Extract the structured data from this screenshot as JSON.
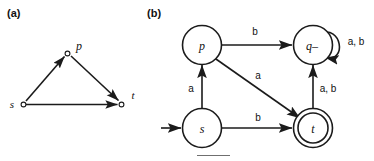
{
  "figure": {
    "panels": [
      {
        "id": "a",
        "label": "(a)",
        "type": "directed-graph",
        "description": "Triangle graph with three vertices and three directed edges",
        "nodes": [
          {
            "id": "s",
            "label": "s",
            "x": 22,
            "y": 104,
            "shape": "small-open-circle"
          },
          {
            "id": "p",
            "label": "p",
            "x": 68,
            "y": 51,
            "shape": "small-open-circle"
          },
          {
            "id": "t",
            "label": "t",
            "x": 122,
            "y": 104,
            "shape": "small-open-circle"
          }
        ],
        "edges": [
          {
            "from": "s",
            "to": "p",
            "label": ""
          },
          {
            "from": "p",
            "to": "t",
            "label": ""
          },
          {
            "from": "s",
            "to": "t",
            "label": ""
          }
        ]
      },
      {
        "id": "b",
        "label": "(b)",
        "type": "finite-automaton",
        "description": "Deterministic finite automaton with states s, p, q- and accepting state t",
        "nodes": [
          {
            "id": "p",
            "label": "p",
            "x": 202,
            "y": 45,
            "accepting": false,
            "start": false
          },
          {
            "id": "q",
            "label": "q–",
            "x": 313,
            "y": 45,
            "accepting": false,
            "start": false
          },
          {
            "id": "s",
            "label": "s",
            "x": 202,
            "y": 128,
            "accepting": false,
            "start": true
          },
          {
            "id": "t",
            "label": "t",
            "x": 313,
            "y": 128,
            "accepting": true,
            "start": false
          }
        ],
        "edges": [
          {
            "from": "s",
            "to": "p",
            "label": "a",
            "kind": "straight-vertical"
          },
          {
            "from": "s",
            "to": "t",
            "label": "b",
            "kind": "straight-horizontal"
          },
          {
            "from": "p",
            "to": "q",
            "label": "b",
            "kind": "straight-horizontal"
          },
          {
            "from": "p",
            "to": "t",
            "label": "a",
            "kind": "diagonal"
          },
          {
            "from": "t",
            "to": "q",
            "label": "a, b",
            "kind": "straight-vertical"
          },
          {
            "from": "q",
            "to": "q",
            "label": "a, b",
            "kind": "self-loop"
          }
        ],
        "start_arrow": {
          "target": "s",
          "from_x": 161,
          "to_x": 183,
          "y": 128
        }
      }
    ]
  },
  "colors": {
    "ink": "#1b1b1b",
    "background": "#ffffff",
    "caption_rule": "#6f6f6f"
  }
}
